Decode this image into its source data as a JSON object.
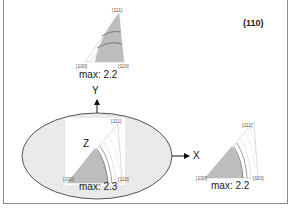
{
  "figure": {
    "plane_label": "(110)",
    "colors": {
      "frame": "#8c8c8c",
      "ellipse_fill": "#ececec",
      "ellipse_stroke": "#555555",
      "contour_fill": "#b9b9b9",
      "contour_line": "#666666",
      "contour_light": "#cfcfcf"
    },
    "axes": {
      "y_label": "Y",
      "z_label": "Z",
      "x_label": "X"
    },
    "pole_figures": [
      {
        "id": "y-direction",
        "corner_labels": {
          "top": "[111]",
          "left": "[100]",
          "right": "[110]"
        },
        "max_label": "max: 2.2"
      },
      {
        "id": "z-direction",
        "corner_labels": {
          "top": "[111]",
          "left": "[100]",
          "right": "[110]"
        },
        "max_label": "max: 2.3"
      },
      {
        "id": "x-direction",
        "corner_labels": {
          "top": "[111]",
          "left": "[100]",
          "right": "[110]"
        },
        "max_label": "max: 2.2"
      }
    ]
  }
}
